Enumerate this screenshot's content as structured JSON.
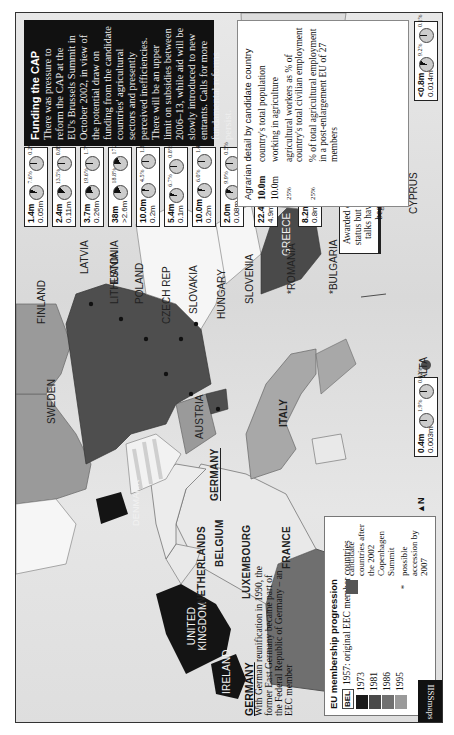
{
  "page": {
    "orientation": "rotated-90-clockwise",
    "publisher_mark": "IISSmaps"
  },
  "funding_box": {
    "title": "Funding the CAP",
    "body": "There was pressure to reform the CAP at the EU's Brussels Summit in October 2002, in view of the potential draw on funding from the candidate countries' agricultural sectors and presently perceived inefficiencies. There will be an upper limit on subsidies between 2006–13, while aid will be slowly introduced to new entrants. Calls for more fundamental reforms persist."
  },
  "agrarian_legend": {
    "title": "Agrarian detail by candidate country",
    "rows": [
      {
        "key": "10.0m",
        "desc": "country's total population"
      },
      {
        "key": "10.0m",
        "desc": "working in agriculture"
      },
      {
        "key": "25%",
        "desc": "agricultural workers as % of country's total civilian employment"
      },
      {
        "key": "25%",
        "desc": "% of total agricultural employment in a post-enlargement EU of 27 members"
      }
    ]
  },
  "candidates": [
    {
      "country": "ESTONIA",
      "population": "1.4m",
      "agri_workers": "0.05m",
      "pct_civilian": "7.6%",
      "pct_eu27": "0.2%",
      "pie1": 7.6,
      "pie2": 0.2
    },
    {
      "country": "LATVIA",
      "population": "2.4m",
      "agri_workers": "0.11m",
      "pct_civilian": "13.5%",
      "pct_eu27": "0.8%",
      "pie1": 13.5,
      "pie2": 0.8
    },
    {
      "country": "LITHUANIA",
      "population": "3.7m",
      "agri_workers": "0.26m",
      "pct_civilian": "19.6%",
      "pct_eu27": "1.7%",
      "pie1": 19.6,
      "pie2": 1.7
    },
    {
      "country": "POLAND",
      "population": "38m",
      "agri_workers": ">2.6m",
      "pct_civilian": "18.8%",
      "pct_eu27": "17.2%",
      "pie1": 18.8,
      "pie2": 17.2
    },
    {
      "country": "CZECH REP",
      "population": "10.0m",
      "agri_workers": "0.2m",
      "pct_civilian": "4.5%",
      "pct_eu27": "1.3%",
      "pie1": 4.5,
      "pie2": 1.3
    },
    {
      "country": "SLOVAKIA",
      "population": "5.4m",
      "agri_workers": "0.1m",
      "pct_civilian": "6.7%",
      "pct_eu27": "0.8%",
      "pie1": 6.7,
      "pie2": 0.8
    },
    {
      "country": "HUNGARY",
      "population": "10.0m",
      "agri_workers": "0.2m",
      "pct_civilian": "6.0%",
      "pct_eu27": "1.4%",
      "pie1": 6.0,
      "pie2": 1.4
    },
    {
      "country": "SLOVENIA",
      "population": "2.0m",
      "agri_workers": "0.08m",
      "pct_civilian": "9.9%",
      "pct_eu27": "0.5%",
      "pie1": 9.9,
      "pie2": 0.5
    },
    {
      "country": "*ROMANIA",
      "population": "22.4m",
      "agri_workers": "4.9m",
      "pct_civilian": "42.8%",
      "pct_eu27": "30.9%",
      "pie1": 42.8,
      "pie2": 30.9
    },
    {
      "country": "*BULGARIA",
      "population": "8.2m",
      "agri_workers": "0.8m",
      "pct_civilian": "26.2%",
      "pct_eu27": "5.1%",
      "pie1": 26.2,
      "pie2": 5.1
    },
    {
      "country": "CYPRUS",
      "population": "<0.8m",
      "agri_workers": "0.014m",
      "pct_civilian": "9.2%",
      "pct_eu27": "0.1%",
      "pie1": 9.2,
      "pie2": 0.1
    },
    {
      "country": "MALTA",
      "population": "0.4m",
      "agri_workers": "0.003m",
      "pct_civilian": "1.9%",
      "pct_eu27": "0.02%",
      "pie1": 1.9,
      "pie2": 0.02
    }
  ],
  "turkey": {
    "label": "TURKEY",
    "note": "Awarded candidate status but accession talks have yet to begin."
  },
  "map_labels": {
    "finland": "FINLAND",
    "sweden": "SWEDEN",
    "denmark": "DENMARK",
    "germany": "GERMANY",
    "austria": "AUSTRIA",
    "italy": "ITALY",
    "greece": "GREECE",
    "united_kingdom": "UNITED KINGDOM",
    "ireland": "IRELAND",
    "netherlands": "NETHERLANDS",
    "belgium": "BELGIUM",
    "luxembourg": "LUXEMBOURG",
    "france": "FRANCE",
    "spain": "SPAIN",
    "portugal": "PORTUGAL",
    "north": "N"
  },
  "eu_legend": {
    "title": "EU membership progression",
    "items": [
      {
        "swatch": "BEL",
        "label": "1957: original EEC member countries",
        "color": "#ffffff"
      },
      {
        "label": "1973",
        "color": "#1a1a1a"
      },
      {
        "label": "1981",
        "color": "#4a4a4a"
      },
      {
        "label": "1986",
        "color": "#707070"
      },
      {
        "label": "1995",
        "color": "#9a9a9a"
      },
      {
        "label": "candidate countries after the 2002 Copenhagen Summit",
        "color": "#555555"
      },
      {
        "symbol": "*",
        "label": "possible accession by 2007"
      }
    ]
  },
  "germany_note": {
    "title": "GERMANY",
    "body": "With German reunification in 1990, the former East Germany became part of the Federal Republic of Germany – an EEC member"
  }
}
